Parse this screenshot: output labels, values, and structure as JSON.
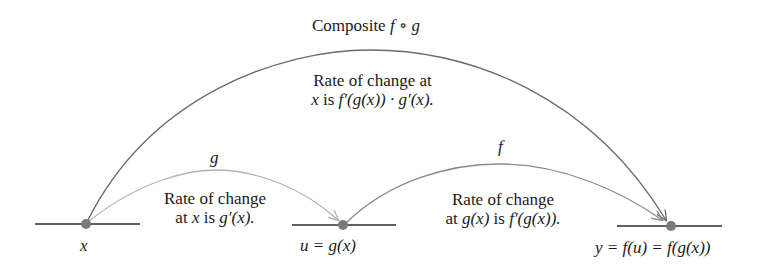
{
  "title": "Composite f ∘ g",
  "title_parts": {
    "word": "Composite ",
    "expr": "f ∘ g"
  },
  "composite_rate": {
    "line1": "Rate of change at",
    "line2_x": "x",
    "line2_is": " is ",
    "line2_expr": "f′(g(x)) · g′(x)."
  },
  "g_arrow": {
    "label": "g",
    "rate_line1": "Rate of change",
    "rate_line2_at": "at ",
    "rate_line2_x": "x",
    "rate_line2_is": " is ",
    "rate_line2_expr": "g′(x)."
  },
  "f_arrow": {
    "label": "f",
    "rate_line1": "Rate of change",
    "rate_line2_at": "at ",
    "rate_line2_gx": "g(x)",
    "rate_line2_is": " is ",
    "rate_line2_expr": "f′(g(x))."
  },
  "points": {
    "x": "x",
    "u": "u = g(x)",
    "y": "y = f(u) = f(g(x))"
  },
  "colors": {
    "axis": "#2b2b2b",
    "point": "#7a7a7a",
    "composite_arc": "#6b6b6b",
    "g_arc": "#b4b4b4",
    "f_arc": "#8a8a8a"
  }
}
